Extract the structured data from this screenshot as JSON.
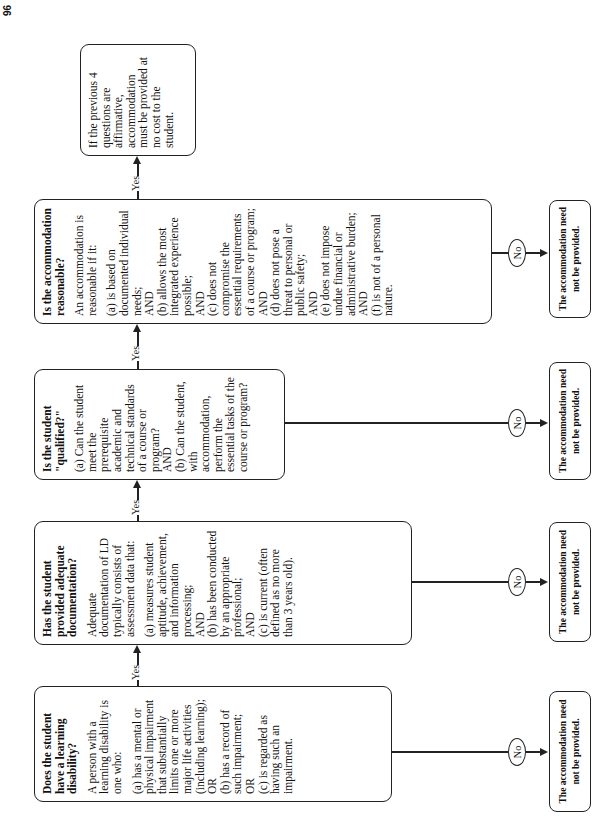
{
  "page_number": "96",
  "boxes": [
    {
      "question": "Does the student have a learning disability?",
      "intro": "A person with a learning disability is one who:",
      "body": "(a) has a mental or physical impairment that substantially limits one or more major life activities (including learning);\nOR\n(b) has a record of such impairment;\nOR\n(c) is regarded as having such an impairment."
    },
    {
      "question": "Has the student provided adequate documentation?",
      "intro": "Adequate documentation of LD typically consists of assessment data that:",
      "body": "(a) measures student aptitude, achievement, and information processing;\nAND\n(b) has been conducted by an appropriate professional;\nAND\n(c) is current (often defined as no more than 3 years old)."
    },
    {
      "question": "Is the student \"qualified?\"",
      "intro": "",
      "body": "(a) Can the student meet the prerequisite academic and technical standards of a course or program?\nAND\n(b) Can the student, with accommodation, perform the essential tasks of the course or program?"
    },
    {
      "question": "Is the accommodation reasonable?",
      "intro": "An accommodation is reasonable if it:",
      "body": "(a) is based on documented individual needs;\nAND\n(b) allows the most integrated experience possible;\nAND\n(c) does not compromise the essential requirements of a course or program;\nAND\n(d) does not pose a threat to personal or public safety;\nAND\n(e) does not impose undue financial or administrative burden;\nAND\n(f) is not of a personal nature."
    }
  ],
  "final_box": "If the previous 4 questions are affirmative, accommodation must be provided at no cost to the student.",
  "yes_label": "Yes",
  "no_label": "No",
  "end_label": "The accommodation need not be provided."
}
